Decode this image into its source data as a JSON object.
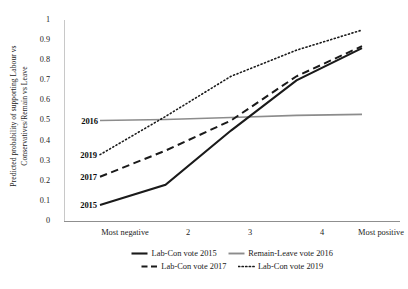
{
  "chart_data": {
    "type": "line",
    "title": "",
    "xlabel": "",
    "ylabel": "Predicted probability of supporting Labour vs Conservatives/Remain vs Leave",
    "categories": [
      "Most negative",
      "2",
      "3",
      "4",
      "Most positive"
    ],
    "ylim": [
      0,
      1
    ],
    "yticks": [
      "0",
      "0.1",
      "0.2",
      "0.3",
      "0.4",
      "0.5",
      "0.6",
      "0.7",
      "0.8",
      "0.9",
      "1"
    ],
    "grid": false,
    "legend_position": "bottom",
    "series": [
      {
        "name": "Lab-Con vote 2015",
        "style": "solid",
        "color": "#1a1a1a",
        "width": 2.1,
        "inline_label": "2015",
        "values": [
          0.08,
          0.18,
          0.45,
          0.7,
          0.86
        ]
      },
      {
        "name": "Remain-Leave vote 2016",
        "style": "solid",
        "color": "#8c8c8c",
        "width": 1.7,
        "inline_label": "2016",
        "values": [
          0.5,
          0.505,
          0.515,
          0.525,
          0.53
        ]
      },
      {
        "name": "Lab-Con vote 2017",
        "style": "dashed",
        "color": "#1a1a1a",
        "width": 2.0,
        "inline_label": "2017",
        "values": [
          0.22,
          0.35,
          0.5,
          0.72,
          0.87
        ]
      },
      {
        "name": "Lab-Con vote 2019",
        "style": "dotted",
        "color": "#1a1a1a",
        "width": 1.6,
        "inline_label": "2019",
        "values": [
          0.33,
          0.52,
          0.72,
          0.85,
          0.95
        ]
      }
    ]
  },
  "axis": {
    "y_tick_0": "0",
    "y_tick_1": "0.1",
    "y_tick_2": "0.2",
    "y_tick_3": "0.3",
    "y_tick_4": "0.4",
    "y_tick_5": "0.5",
    "y_tick_6": "0.6",
    "y_tick_7": "0.7",
    "y_tick_8": "0.8",
    "y_tick_9": "0.9",
    "y_tick_10": "1",
    "x_tick_0": "Most negative",
    "x_tick_1": "2",
    "x_tick_2": "3",
    "x_tick_3": "4",
    "x_tick_4": "Most positive"
  },
  "annotations": {
    "tag_2015": "2015",
    "tag_2016": "2016",
    "tag_2017": "2017",
    "tag_2019": "2019"
  },
  "legend": {
    "item_1": "Lab-Con vote 2015",
    "item_2": "Remain-Leave vote 2016",
    "item_3": "Lab-Con vote 2017",
    "item_4": "Lab-Con vote 2019"
  }
}
